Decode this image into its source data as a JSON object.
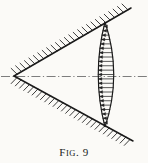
{
  "figure": {
    "caption_full": "FIG. 9",
    "caption_label_lead": "F",
    "caption_label_rest": "IG",
    "caption_punct": ". ",
    "caption_number": "9",
    "background_color": "#fbfaf7",
    "ink_color": "#1a1a1a",
    "axis_color": "#6e6e6e",
    "arrow_color": "#222222"
  },
  "geometry": {
    "apex": {
      "x": 14,
      "y": 76
    },
    "upper_wall": {
      "x1": 14,
      "y1": 76,
      "x2": 131,
      "y2": 8
    },
    "lower_wall": {
      "x1": 14,
      "y1": 76,
      "x2": 133,
      "y2": 141
    },
    "axis_line": {
      "x1": 1,
      "y1": 76.5,
      "x2": 147,
      "y2": 76.5
    },
    "lens": {
      "top_vertex": {
        "x": 105,
        "y": 22
      },
      "bottom_vertex": {
        "x": 105,
        "y": 127
      },
      "left_bulge_x": 91.5,
      "right_bulge_x": 122.5
    },
    "hatch": {
      "upper_count": 26,
      "lower_count": 28,
      "length": 8
    },
    "arrows": {
      "count": 23,
      "direction": "left",
      "head_length": 3.6
    }
  },
  "elements": {
    "upper_wall_name": "upper converging wall",
    "lower_wall_name": "lower converging wall",
    "axis_name": "axis of symmetry",
    "lens_name": "lens-shaped flow region",
    "arrow_field_name": "velocity vector field"
  }
}
